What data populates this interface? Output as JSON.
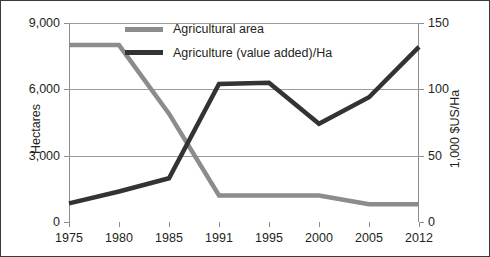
{
  "chart_data": {
    "type": "line",
    "title": "",
    "xlabel": "",
    "categories": [
      "1975",
      "1980",
      "1985",
      "1991",
      "1995",
      "2000",
      "2005",
      "2012"
    ],
    "grid": true,
    "legend_position": "inside-top-center",
    "axes": {
      "left": {
        "label": "Hectares",
        "ticks": [
          "0",
          "3,000",
          "6,000",
          "9,000"
        ],
        "tick_values": [
          0,
          3000,
          6000,
          9000
        ],
        "ylim": [
          0,
          9000
        ]
      },
      "right": {
        "label": "1,000 $US/Ha",
        "ticks": [
          "0",
          "50",
          "100",
          "150"
        ],
        "tick_values": [
          0,
          50,
          100,
          150
        ],
        "ylim": [
          0,
          150
        ]
      }
    },
    "series": [
      {
        "name": "Agricultural area",
        "axis": "left",
        "color": "#8c8c8c",
        "values": [
          8000,
          8000,
          4900,
          1200,
          1200,
          1200,
          800,
          800
        ]
      },
      {
        "name": "Agriculture (value added)/Ha",
        "axis": "right",
        "color": "#333333",
        "values": [
          14,
          23,
          33,
          104,
          105,
          74,
          94,
          132
        ]
      }
    ]
  },
  "legend": {
    "items": [
      {
        "label": "Agricultural area",
        "color": "#8c8c8c"
      },
      {
        "label": "Agriculture (value added)/Ha",
        "color": "#333333"
      }
    ]
  }
}
